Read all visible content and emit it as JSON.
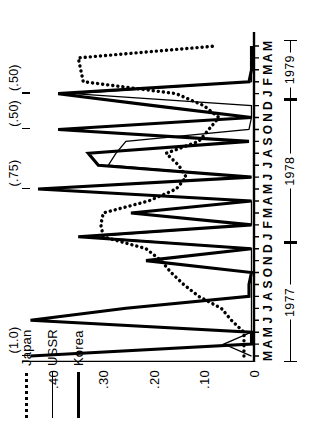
{
  "figure": {
    "rotation_deg": -90,
    "background": "#ffffff",
    "ink": "#000000"
  },
  "legend": {
    "position": "top-left",
    "items": [
      {
        "label": "Japan",
        "style": "dotted",
        "swatch": "dotted-line-swatch"
      },
      {
        "label": "USSR",
        "style": "thin-solid",
        "swatch": "thin-line-swatch"
      },
      {
        "label": "Korea",
        "style": "thick-solid",
        "swatch": "thick-line-swatch"
      }
    ]
  },
  "chart_data": {
    "type": "line",
    "title": "",
    "subtitle": "",
    "xlabel": "",
    "ylabel": "",
    "grid": false,
    "legend_position": "top-left",
    "ylim": [
      0,
      0.45
    ],
    "yticks": [
      0,
      0.1,
      0.2,
      0.3,
      0.4
    ],
    "ytick_labels": [
      "0",
      ".10",
      ".20",
      ".30",
      ".40"
    ],
    "xtick_labels": [
      "M",
      "A",
      "M",
      "J",
      "J",
      "A",
      "S",
      "O",
      "N",
      "D",
      "J",
      "F",
      "M",
      "A",
      "M",
      "J",
      "J",
      "A",
      "S",
      "O",
      "N",
      "D",
      "J",
      "F",
      "M",
      "A",
      "M"
    ],
    "x": [
      "1977-03",
      "1977-04",
      "1977-05",
      "1977-06",
      "1977-07",
      "1977-08",
      "1977-09",
      "1977-10",
      "1977-11",
      "1977-12",
      "1978-01",
      "1978-02",
      "1978-03",
      "1978-04",
      "1978-05",
      "1978-06",
      "1978-07",
      "1978-08",
      "1978-09",
      "1978-10",
      "1978-11",
      "1978-12",
      "1979-01",
      "1979-02",
      "1979-03",
      "1979-04",
      "1979-05"
    ],
    "year_bands": [
      {
        "label": "1977",
        "start_index": 0,
        "end_index": 9
      },
      {
        "label": "1978",
        "start_index": 10,
        "end_index": 21
      },
      {
        "label": "1979",
        "start_index": 22,
        "end_index": 26
      }
    ],
    "series": [
      {
        "name": "Korea",
        "style": "thick-solid",
        "values": [
          0.445,
          0.005,
          0.005,
          0.445,
          0.255,
          0.01,
          0.01,
          0.005,
          0.215,
          0.005,
          0.35,
          0.005,
          0.245,
          0.005,
          0.43,
          0.005,
          0.31,
          0.33,
          0.01,
          0.39,
          0.005,
          0.2,
          0.39,
          0.01,
          0.005,
          0.005,
          0.005
        ]
      },
      {
        "name": "USSR",
        "style": "thin-solid",
        "values": [
          0.005,
          0.06,
          0.005,
          0.005,
          0.005,
          0.005,
          0.005,
          0.005,
          0.005,
          0.005,
          0.33,
          0.005,
          0.005,
          0.005,
          0.43,
          0.005,
          0.29,
          0.275,
          0.255,
          0.01,
          0.005,
          0.005,
          0.36,
          0.005,
          0.005,
          0.005,
          0.005
        ]
      },
      {
        "name": "Japan",
        "style": "dotted",
        "values": [
          0.02,
          0.02,
          0.02,
          0.045,
          0.065,
          0.11,
          0.14,
          0.165,
          0.185,
          0.215,
          0.3,
          0.305,
          0.3,
          0.21,
          0.155,
          0.135,
          0.15,
          0.175,
          0.11,
          0.09,
          0.07,
          0.1,
          0.155,
          0.34,
          0.345,
          0.35,
          0.075
        ]
      }
    ],
    "annotations": [
      {
        "text": "(1.0)",
        "x_index": 0,
        "note": "Korea peak exceeds axis"
      },
      {
        "text": "(.75)",
        "x_index": 14,
        "note": "Korea peak exceeds axis"
      },
      {
        "text": "(.50)",
        "x_index": 19,
        "note": "Korea peak exceeds axis"
      },
      {
        "text": "(.50)",
        "x_index": 22,
        "note": "Korea peak exceeds axis"
      }
    ]
  }
}
